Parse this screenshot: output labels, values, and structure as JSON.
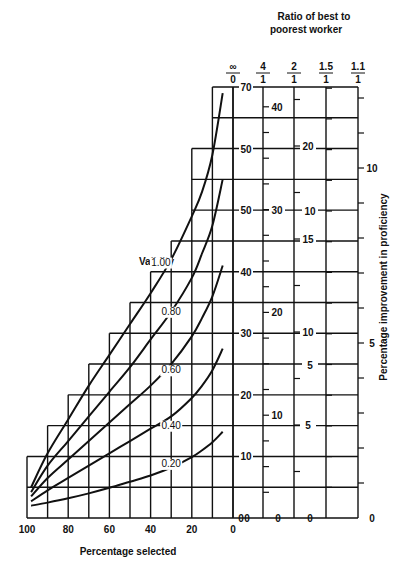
{
  "chart_data": {
    "type": "line",
    "title": "",
    "xlabel": "Percentage selected",
    "ylabel_right": "Percentage improvement in proficiency",
    "top_title": "Ratio of best to poorest worker",
    "legend_title": "Validity",
    "x_ticks": [
      "100",
      "80",
      "60",
      "40",
      "20",
      "0"
    ],
    "x_reversed": true,
    "xlim": [
      100,
      0
    ],
    "main_axis": {
      "ticks": [
        {
          "value": 0,
          "label": "0"
        },
        {
          "value": 10,
          "label": "10"
        },
        {
          "value": 20,
          "label": "20"
        },
        {
          "value": 30,
          "label": "30"
        },
        {
          "value": 40,
          "label": "40"
        },
        {
          "value": 50,
          "label": "50"
        },
        {
          "value": 60,
          "label": "50"
        },
        {
          "value": 70,
          "label": "70"
        }
      ],
      "ylim": [
        0,
        70
      ]
    },
    "ratio_axes": [
      {
        "header_top": "∞",
        "header_bottom": "0",
        "ticks": []
      },
      {
        "header_top": "4",
        "header_bottom": "1",
        "labels": [
          {
            "value": 0,
            "label": "0"
          },
          {
            "value": 10,
            "label": "10"
          },
          {
            "value": 20,
            "label": "20"
          },
          {
            "value": 30,
            "label": "30"
          },
          {
            "value": 40,
            "label": "40"
          }
        ]
      },
      {
        "header_top": "2",
        "header_bottom": "1",
        "labels": [
          {
            "value": 0,
            "label": "0"
          },
          {
            "value": 5,
            "label": "5"
          },
          {
            "value": 10,
            "label": "10"
          },
          {
            "value": 15,
            "label": "15"
          },
          {
            "value": 20,
            "label": "20"
          }
        ]
      },
      {
        "header_top": "1.5",
        "header_bottom": "1",
        "labels": [
          {
            "value": 0,
            "label": "0"
          },
          {
            "value": 5,
            "label": "5"
          },
          {
            "value": 10,
            "label": "10"
          }
        ]
      },
      {
        "header_top": "1.1",
        "header_bottom": "1",
        "labels": [
          {
            "value": 0,
            "label": "0"
          },
          {
            "value": 5,
            "label": "5"
          },
          {
            "value": 10,
            "label": "10"
          }
        ]
      }
    ],
    "grid_staircase": [
      {
        "x_from": 100,
        "x_to": 90,
        "top": 10
      },
      {
        "x_from": 90,
        "x_to": 80,
        "top": 15
      },
      {
        "x_from": 80,
        "x_to": 70,
        "top": 20
      },
      {
        "x_from": 70,
        "x_to": 60,
        "top": 25
      },
      {
        "x_from": 60,
        "x_to": 50,
        "top": 30
      },
      {
        "x_from": 50,
        "x_to": 40,
        "top": 35
      },
      {
        "x_from": 40,
        "x_to": 30,
        "top": 40
      },
      {
        "x_from": 30,
        "x_to": 20,
        "top": 45
      },
      {
        "x_from": 20,
        "x_to": 10,
        "top": 60
      },
      {
        "x_from": 10,
        "x_to": 0,
        "top": 70
      }
    ],
    "series": [
      {
        "name": "1.00",
        "label_pos": {
          "x": 35,
          "y": 41
        },
        "x": [
          98,
          90,
          80,
          70,
          60,
          50,
          40,
          30,
          20,
          15,
          10,
          5
        ],
        "y": [
          5,
          10.5,
          16,
          21.5,
          26.5,
          31.5,
          36.5,
          42,
          49,
          53,
          59,
          69
        ]
      },
      {
        "name": "0.80",
        "label_pos": {
          "x": 30,
          "y": 33
        },
        "x": [
          98,
          90,
          80,
          70,
          60,
          50,
          40,
          30,
          20,
          15,
          10,
          5
        ],
        "y": [
          4.2,
          8.5,
          12.5,
          16.5,
          20.5,
          24.5,
          29,
          33.5,
          39,
          43,
          47.5,
          55
        ]
      },
      {
        "name": "0.60",
        "label_pos": {
          "x": 30,
          "y": 23.5
        },
        "x": [
          98,
          90,
          80,
          70,
          60,
          50,
          40,
          30,
          20,
          15,
          10,
          5
        ],
        "y": [
          3.5,
          6.5,
          9.5,
          12.5,
          15.5,
          18.5,
          21.5,
          25,
          29.5,
          32.5,
          36,
          41
        ]
      },
      {
        "name": "0.40",
        "label_pos": {
          "x": 30,
          "y": 14.5
        },
        "x": [
          98,
          90,
          80,
          70,
          60,
          50,
          40,
          30,
          20,
          15,
          10,
          5
        ],
        "y": [
          2.7,
          4.5,
          6.5,
          8.5,
          10.5,
          12.5,
          14.5,
          16.5,
          19.5,
          21.5,
          24,
          27.5
        ]
      },
      {
        "name": "0.20",
        "label_pos": {
          "x": 30,
          "y": 8.3
        },
        "x": [
          98,
          90,
          80,
          70,
          60,
          50,
          40,
          30,
          20,
          15,
          10,
          5
        ],
        "y": [
          2.0,
          2.5,
          3.2,
          4.0,
          4.9,
          5.9,
          6.9,
          8.2,
          9.9,
          11.0,
          12.3,
          14.0
        ]
      }
    ]
  }
}
